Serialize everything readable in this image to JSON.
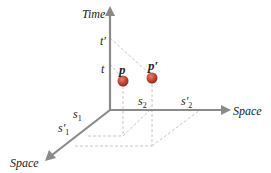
{
  "diagram": {
    "axes": {
      "time": {
        "label": "Time"
      },
      "space_horizontal": {
        "label": "Space"
      },
      "space_diagonal": {
        "label": "Space"
      }
    },
    "time_ticks": {
      "t": "t",
      "t_prime": "t′"
    },
    "horizontal_ticks": {
      "s2": "s",
      "s2_sub": "2",
      "s2_prime": "s′",
      "s2_prime_sub": "2"
    },
    "diagonal_ticks": {
      "s1": "s",
      "s1_sub": "1",
      "s1_prime": "s′",
      "s1_prime_sub": "1"
    },
    "points": [
      {
        "label": "p",
        "color": "#c0392b"
      },
      {
        "label": "p′",
        "color": "#c0392b"
      }
    ],
    "colors": {
      "axis": "#8a8a8a",
      "dashed": "#c8c8c8",
      "point": "#c44a3a"
    }
  }
}
